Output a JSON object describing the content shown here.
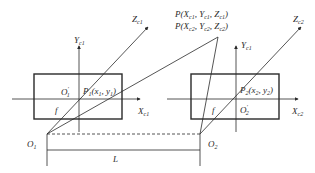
{
  "diagram": {
    "type": "stereo-vision-geometry",
    "colors": {
      "line": "#2a2a2a",
      "background": "#ffffff"
    },
    "point_label": {
      "line1": {
        "prefix": "P(X",
        "s1": "c1",
        "m1": ", Y",
        "s2": "c1",
        "m2": ", Z",
        "s3": "c1",
        "suffix": ")"
      },
      "line2": {
        "prefix": "P(X",
        "s1": "c2",
        "m1": ", Y",
        "s2": "c2",
        "m2": ", Z",
        "s3": "c2",
        "suffix": ")"
      }
    },
    "left_camera": {
      "y_axis": {
        "main": "Y",
        "sub": "c1"
      },
      "z_axis": {
        "main": "Z",
        "sub": "c1"
      },
      "x_axis": {
        "main": "X",
        "sub": "c1"
      },
      "principal_point": {
        "main": "O",
        "sub": "1",
        "sup": "′"
      },
      "image_point": {
        "main": "P",
        "sub": "1",
        "coords_open": "(x",
        "cs1": "1",
        "cmid": ", y",
        "cs2": "1",
        "close": ")"
      },
      "focal": "f",
      "optical_center": {
        "main": "O",
        "sub": "1"
      }
    },
    "right_camera": {
      "y_axis": {
        "main": "Y",
        "sub": "c1"
      },
      "z_axis": {
        "main": "Z",
        "sub": "c2"
      },
      "x_axis": {
        "main": "X",
        "sub": "c2"
      },
      "principal_point": {
        "main": "O",
        "sub": "2",
        "sup": "′"
      },
      "image_point": {
        "main": "P",
        "sub": "2",
        "coords_open": "(x",
        "cs1": "2",
        "cmid": ", y",
        "cs2": "2",
        "close": ")"
      },
      "focal": "f",
      "optical_center": {
        "main": "O",
        "sub": "2"
      }
    },
    "baseline": {
      "label": "L"
    }
  }
}
